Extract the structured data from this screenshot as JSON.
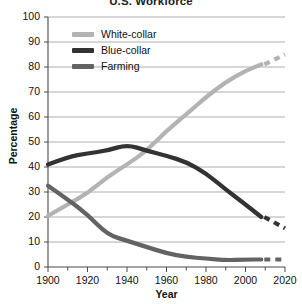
{
  "chart_data": {
    "type": "line",
    "title": "U.S. Workforce",
    "xlabel": "Year",
    "ylabel": "Percentage",
    "xlim": [
      1900,
      2020
    ],
    "ylim": [
      0,
      100
    ],
    "grid": true,
    "legend_position": "top-left-inside",
    "xticks": [
      "1900",
      "1920",
      "1940",
      "1960",
      "1980",
      "2000",
      "2020"
    ],
    "xtick_values": [
      1900,
      1920,
      1940,
      1960,
      1980,
      2000,
      2020
    ],
    "xminor_step": 10,
    "yticks": [
      "0",
      "10",
      "20",
      "30",
      "40",
      "50",
      "60",
      "70",
      "80",
      "90",
      "100"
    ],
    "ytick_values": [
      0,
      10,
      20,
      30,
      40,
      50,
      60,
      70,
      80,
      90,
      100
    ],
    "series": [
      {
        "name": "White-collar",
        "color": "#b3b3b3",
        "x": [
          1900,
          1910,
          1920,
          1930,
          1940,
          1950,
          1960,
          1970,
          1980,
          1990,
          2000,
          2008
        ],
        "values": [
          20.5,
          25,
          29.5,
          36,
          41,
          46.5,
          54.5,
          61,
          68,
          74,
          78.5,
          81
        ],
        "projection_x": [
          2008,
          2020
        ],
        "projection_values": [
          81,
          85
        ],
        "projection_style": "dashed"
      },
      {
        "name": "Blue-collar",
        "color": "#333333",
        "x": [
          1900,
          1910,
          1920,
          1930,
          1940,
          1950,
          1960,
          1970,
          1980,
          1990,
          2000,
          2008
        ],
        "values": [
          41,
          44,
          45.5,
          46.5,
          49,
          46.5,
          44.5,
          42,
          37.5,
          31,
          25,
          20
        ],
        "projection_x": [
          2008,
          2020
        ],
        "projection_values": [
          20,
          15.5
        ],
        "projection_style": "dashed"
      },
      {
        "name": "Farming",
        "color": "#636363",
        "x": [
          1900,
          1910,
          1920,
          1930,
          1940,
          1950,
          1960,
          1970,
          1980,
          1990,
          2000,
          2008
        ],
        "values": [
          32.5,
          27,
          21,
          13,
          10.5,
          8,
          5.5,
          4,
          3.4,
          2.7,
          3,
          3
        ],
        "projection_x": [
          2008,
          2020
        ],
        "projection_values": [
          3,
          3
        ],
        "projection_style": "dashed"
      }
    ]
  }
}
